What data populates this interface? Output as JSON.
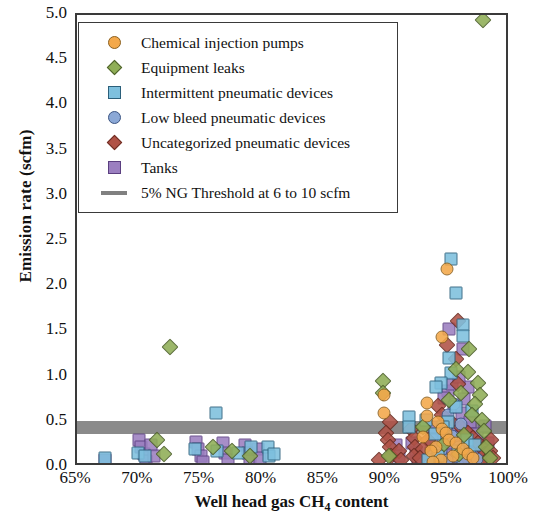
{
  "chart_data": {
    "type": "scatter",
    "title": "",
    "xlabel": "Well head gas CH4 content",
    "xlabel_html": "Well head gas CH<sub>4</sub> content",
    "ylabel": "Emission rate (scfm)",
    "xlim": [
      65,
      100
    ],
    "ylim": [
      0.0,
      5.0
    ],
    "grid": false,
    "legend_position": "upper-left-inside",
    "x_ticks": [
      "65%",
      "70%",
      "75%",
      "80%",
      "85%",
      "90%",
      "95%",
      "100%"
    ],
    "x_tick_values": [
      65,
      70,
      75,
      80,
      85,
      90,
      95,
      100
    ],
    "y_ticks": [
      "0.0",
      "0.5",
      "1.0",
      "1.5",
      "2.0",
      "2.5",
      "3.0",
      "3.5",
      "4.0",
      "4.5",
      "5.0"
    ],
    "y_tick_values": [
      0.0,
      0.5,
      1.0,
      1.5,
      2.0,
      2.5,
      3.0,
      3.5,
      4.0,
      4.5,
      5.0
    ],
    "annotations": {
      "threshold_band": {
        "label": "5% NG Threshold at 6 to 10 scfm",
        "y_low": 0.37,
        "y_high": 0.51,
        "color": "#808080"
      }
    },
    "series": [
      {
        "name": "Chemical injection pumps",
        "marker": "circle",
        "color": "#f3a84a",
        "edge": "#8a6020",
        "points": [
          [
            94.9,
            2.19
          ],
          [
            94.5,
            1.44
          ],
          [
            93.3,
            0.71
          ],
          [
            93.3,
            0.56
          ],
          [
            94.2,
            0.5
          ],
          [
            94.5,
            0.42
          ],
          [
            94.8,
            0.38
          ],
          [
            93.0,
            0.33
          ],
          [
            95.1,
            0.3
          ],
          [
            95.6,
            0.26
          ],
          [
            94.0,
            0.22
          ],
          [
            93.6,
            0.18
          ],
          [
            89.8,
            0.8
          ],
          [
            89.8,
            0.6
          ],
          [
            96.2,
            0.2
          ],
          [
            96.6,
            0.14
          ],
          [
            95.4,
            0.12
          ],
          [
            97.0,
            0.1
          ],
          [
            94.4,
            0.08
          ],
          [
            93.8,
            0.06
          ]
        ]
      },
      {
        "name": "Equipment leaks",
        "marker": "diamond",
        "color": "#8fae56",
        "edge": "#4c5f2a",
        "points": [
          [
            97.8,
            4.95
          ],
          [
            72.5,
            1.33
          ],
          [
            96.7,
            1.3
          ],
          [
            96.6,
            1.05
          ],
          [
            95.6,
            1.08
          ],
          [
            97.4,
            0.93
          ],
          [
            97.6,
            0.8
          ],
          [
            96.0,
            0.82
          ],
          [
            97.2,
            0.7
          ],
          [
            89.7,
            0.95
          ],
          [
            89.7,
            0.82
          ],
          [
            95.1,
            0.74
          ],
          [
            96.9,
            0.58
          ],
          [
            97.7,
            0.52
          ],
          [
            93.0,
            0.44
          ],
          [
            90.2,
            0.12
          ],
          [
            97.9,
            0.4
          ],
          [
            96.3,
            0.35
          ],
          [
            94.7,
            0.25
          ],
          [
            98.1,
            0.22
          ],
          [
            76.0,
            0.22
          ],
          [
            77.5,
            0.18
          ],
          [
            71.5,
            0.3
          ],
          [
            72.0,
            0.14
          ],
          [
            79.0,
            0.12
          ],
          [
            95.9,
            0.14
          ],
          [
            98.4,
            0.1
          ]
        ]
      },
      {
        "name": "Intermittent pneumatic devices",
        "marker": "square",
        "color": "#7ec0de",
        "edge": "#2b5f7a",
        "points": [
          [
            95.2,
            2.3
          ],
          [
            95.6,
            1.93
          ],
          [
            96.2,
            1.57
          ],
          [
            96.2,
            1.45
          ],
          [
            95.1,
            1.21
          ],
          [
            95.2,
            1.04
          ],
          [
            94.4,
            0.93
          ],
          [
            94.0,
            0.88
          ],
          [
            76.2,
            0.6
          ],
          [
            91.8,
            0.55
          ],
          [
            91.8,
            0.44
          ],
          [
            93.2,
            0.52
          ],
          [
            95.6,
            0.66
          ],
          [
            96.9,
            0.62
          ],
          [
            95.0,
            0.5
          ],
          [
            94.6,
            0.44
          ],
          [
            93.9,
            0.36
          ],
          [
            80.4,
            0.22
          ],
          [
            80.5,
            0.12
          ],
          [
            80.9,
            0.14
          ],
          [
            67.3,
            0.1
          ],
          [
            69.9,
            0.16
          ],
          [
            70.5,
            0.12
          ],
          [
            74.5,
            0.2
          ],
          [
            76.3,
            0.18
          ],
          [
            78.0,
            0.15
          ],
          [
            79.1,
            0.22
          ],
          [
            96.5,
            0.3
          ],
          [
            97.2,
            0.24
          ],
          [
            95.8,
            0.18
          ],
          [
            94.2,
            0.12
          ],
          [
            93.4,
            0.08
          ]
        ]
      },
      {
        "name": "Low bleed pneumatic devices",
        "marker": "circle",
        "color": "#8ba8d6",
        "edge": "#3c5583",
        "points": [
          [
            95.5,
            0.7
          ],
          [
            95.0,
            0.58
          ],
          [
            96.0,
            0.48
          ],
          [
            94.8,
            0.42
          ],
          [
            95.3,
            0.34
          ],
          [
            96.4,
            0.28
          ],
          [
            95.9,
            0.22
          ],
          [
            94.4,
            0.18
          ],
          [
            96.8,
            0.15
          ],
          [
            95.6,
            0.11
          ],
          [
            94.9,
            0.08
          ],
          [
            96.2,
            0.05
          ],
          [
            93.8,
            0.12
          ],
          [
            97.3,
            0.09
          ]
        ]
      },
      {
        "name": "Uncategorized pneumatic devices",
        "marker": "diamond",
        "color": "#b05246",
        "edge": "#6b2c22",
        "points": [
          [
            95.8,
            1.62
          ],
          [
            94.9,
            1.35
          ],
          [
            95.6,
            1.2
          ],
          [
            95.8,
            0.92
          ],
          [
            90.3,
            0.5
          ],
          [
            90.0,
            0.38
          ],
          [
            90.1,
            0.3
          ],
          [
            90.3,
            0.22
          ],
          [
            90.4,
            0.12
          ],
          [
            92.0,
            0.42
          ],
          [
            92.2,
            0.32
          ],
          [
            92.3,
            0.22
          ],
          [
            92.2,
            0.12
          ],
          [
            94.2,
            0.68
          ],
          [
            94.5,
            0.58
          ],
          [
            95.2,
            0.5
          ],
          [
            96.0,
            0.44
          ],
          [
            96.6,
            0.38
          ],
          [
            97.0,
            0.32
          ],
          [
            97.4,
            0.26
          ],
          [
            97.8,
            0.2
          ],
          [
            98.0,
            0.14
          ],
          [
            98.2,
            0.09
          ],
          [
            97.6,
            0.06
          ],
          [
            93.4,
            0.3
          ],
          [
            93.0,
            0.2
          ],
          [
            92.7,
            0.1
          ],
          [
            91.0,
            0.18
          ],
          [
            91.2,
            0.08
          ],
          [
            96.4,
            0.12
          ],
          [
            95.1,
            0.06
          ],
          [
            94.0,
            0.04
          ],
          [
            89.4,
            0.08
          ],
          [
            98.5,
            0.3
          ],
          [
            98.4,
            0.18
          ],
          [
            98.6,
            0.1
          ]
        ]
      },
      {
        "name": "Tanks",
        "marker": "square",
        "color": "#9b7fc0",
        "edge": "#5b3f80",
        "points": [
          [
            95.1,
            1.53
          ],
          [
            96.2,
            1.3
          ],
          [
            95.0,
            0.84
          ],
          [
            96.3,
            0.75
          ],
          [
            95.5,
            0.66
          ],
          [
            96.1,
            0.6
          ],
          [
            94.8,
            0.54
          ],
          [
            95.2,
            0.46
          ],
          [
            96.5,
            0.42
          ],
          [
            94.5,
            0.38
          ],
          [
            95.7,
            0.33
          ],
          [
            96.0,
            0.28
          ],
          [
            94.9,
            0.24
          ],
          [
            95.4,
            0.2
          ],
          [
            96.7,
            0.17
          ],
          [
            95.0,
            0.13
          ],
          [
            94.4,
            0.1
          ],
          [
            95.8,
            0.07
          ],
          [
            96.4,
            0.05
          ],
          [
            97.1,
            0.21
          ],
          [
            97.4,
            0.14
          ],
          [
            97.0,
            0.08
          ],
          [
            93.6,
            0.16
          ],
          [
            93.3,
            0.08
          ],
          [
            67.3,
            0.08
          ],
          [
            70.0,
            0.3
          ],
          [
            70.2,
            0.22
          ],
          [
            70.4,
            0.14
          ],
          [
            70.6,
            0.07
          ],
          [
            71.0,
            0.24
          ],
          [
            71.2,
            0.12
          ],
          [
            74.6,
            0.28
          ],
          [
            74.8,
            0.2
          ],
          [
            75.0,
            0.12
          ],
          [
            75.2,
            0.05
          ],
          [
            76.8,
            0.26
          ],
          [
            77.0,
            0.16
          ],
          [
            77.2,
            0.08
          ],
          [
            78.6,
            0.24
          ],
          [
            78.8,
            0.15
          ],
          [
            79.0,
            0.07
          ],
          [
            79.6,
            0.2
          ],
          [
            79.8,
            0.1
          ],
          [
            92.1,
            0.26
          ],
          [
            92.4,
            0.15
          ],
          [
            92.6,
            0.07
          ],
          [
            90.8,
            0.24
          ],
          [
            91.0,
            0.12
          ],
          [
            93.9,
            0.44
          ],
          [
            93.7,
            0.3
          ],
          [
            94.1,
            0.2
          ],
          [
            94.3,
            0.1
          ],
          [
            96.8,
            0.5
          ],
          [
            97.3,
            0.36
          ],
          [
            98.0,
            0.45
          ],
          [
            98.2,
            0.26
          ],
          [
            95.3,
            0.92
          ],
          [
            94.7,
            0.76
          ],
          [
            96.6,
            0.88
          ],
          [
            95.9,
            1.0
          ]
        ]
      }
    ]
  },
  "legend": {
    "items": [
      {
        "label": "Chemical injection pumps",
        "marker": "circle",
        "color": "#f3a84a",
        "edge": "#8a6020"
      },
      {
        "label": "Equipment leaks",
        "marker": "diamond",
        "color": "#8fae56",
        "edge": "#4c5f2a"
      },
      {
        "label": "Intermittent pneumatic devices",
        "marker": "square",
        "color": "#7ec0de",
        "edge": "#2b5f7a"
      },
      {
        "label": "Low bleed pneumatic devices",
        "marker": "circle",
        "color": "#8ba8d6",
        "edge": "#3c5583"
      },
      {
        "label": "Uncategorized pneumatic devices",
        "marker": "diamond",
        "color": "#b05246",
        "edge": "#6b2c22"
      },
      {
        "label": "Tanks",
        "marker": "square",
        "color": "#9b7fc0",
        "edge": "#5b3f80"
      },
      {
        "label": "5% NG Threshold at 6 to 10 scfm",
        "marker": "line",
        "color": "#808080",
        "edge": "#808080"
      }
    ]
  }
}
